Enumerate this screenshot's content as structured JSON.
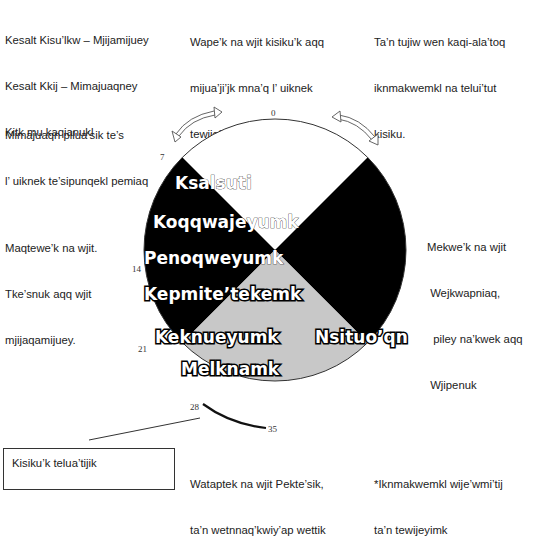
{
  "annotations": {
    "top_left": [
      "Kesalt Kisu’lkw – Mjijamijuey",
      "Kesalt Kkij – Mimajuaqney",
      "Kitk mu kaqianukl"
    ],
    "top_center": [
      "Wape’k na wjit kisiku’k aqq",
      "mijua’ji’jk mna’q l’ uiknek",
      "tewijo’lti’k aqq elp wjit",
      "Oqwatnuk"
    ],
    "top_right": [
      "Ta’n tujiw wen kaqi-ala’toq",
      "iknmakwemkl na telui’tut",
      "kisiku."
    ],
    "upper_left": [
      "Mimajuaqn pilua’sik te’s",
      "l’ uiknek te’sipunqekl pemiaq"
    ],
    "mid_left": [
      "Maqtewe’k na wjit.",
      "Tke’snuk aqq wjit",
      "mjijaqamijuey."
    ],
    "mid_right": [
      "Mekwe’k na wjit",
      " Wejkwapniaq,",
      "  piley na’kwek aqq",
      " Wjipenuk"
    ],
    "bottom_box": "Kisiku’k telua’tijik",
    "bottom_center": [
      "Wataptek na wjit Pekte’sik,",
      "ta’n wetnnaq’kwiy’ap wettik"
    ],
    "bottom_right": [
      "*Iknmakwemkl wije’wmi’tij",
      "ta’n tewijeyimk"
    ]
  },
  "wheel": {
    "ticks": [
      {
        "label": "0"
      },
      {
        "label": "7"
      },
      {
        "label": "14"
      },
      {
        "label": "21"
      },
      {
        "label": "28"
      },
      {
        "label": "35"
      }
    ],
    "segments": [
      {
        "name": "top",
        "color": "#ffffff"
      },
      {
        "name": "left",
        "color": "#000000"
      },
      {
        "name": "right",
        "color": "#000000"
      },
      {
        "name": "bottom",
        "color": "#c8c8c8"
      }
    ],
    "labels": [
      {
        "text": "Ksalsuti"
      },
      {
        "text": "Koqqwajeyumk"
      },
      {
        "text": "Penoqweyumk"
      },
      {
        "text": "Kepmite’tekemk"
      },
      {
        "text": "Keknueyumk"
      },
      {
        "text": "Melknamk"
      },
      {
        "text": "Nsituo’qn"
      }
    ]
  },
  "colors": {
    "black_segment": "#000000",
    "gray_segment": "#c8c8c8",
    "outline": "#333333"
  }
}
